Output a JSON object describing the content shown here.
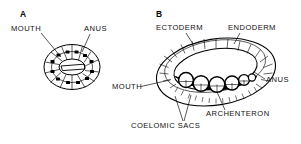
{
  "figure": {
    "kind": "biological-diagram",
    "background_color": "#ffffff",
    "ink_color": "#000000",
    "fill_color": "#ffffff",
    "dark_fill_color": "#000000"
  },
  "panels": [
    {
      "id": "A",
      "letter": "A",
      "description": "ring of cuboidal cells with slit-like lumen, mouth and anus on the ring",
      "labels": [
        {
          "name": "mouth",
          "text": "MOUTH"
        },
        {
          "name": "anus",
          "text": "ANUS"
        }
      ]
    },
    {
      "id": "B",
      "letter": "B",
      "description": "three-dimensional ring-shaped embryo; double-walled epithelium with radial cell boundaries, dark archenteron band and row of coelomic sacs along the lower inner surface",
      "labels": [
        {
          "name": "ectoderm",
          "text": "ECTODERM"
        },
        {
          "name": "endoderm",
          "text": "ENDODERM"
        },
        {
          "name": "mouth",
          "text": "MOUTH"
        },
        {
          "name": "anus",
          "text": "ANUS"
        },
        {
          "name": "archenteron",
          "text": "ARCHENTERON"
        },
        {
          "name": "coelomic-sacs",
          "text": "COELOMIC SACS"
        }
      ]
    }
  ]
}
